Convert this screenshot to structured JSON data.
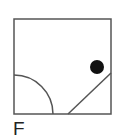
{
  "figure": {
    "label": "F",
    "frame": {
      "x": 14,
      "y": 19,
      "width": 97,
      "height": 95,
      "stroke": "#555555"
    },
    "arc": {
      "cx": 14,
      "cy": 114,
      "r": 39,
      "stroke": "#555555"
    },
    "line": {
      "x1": 68,
      "y1": 114,
      "x2": 111,
      "y2": 73,
      "stroke": "#555555"
    },
    "dot": {
      "cx": 97,
      "cy": 67,
      "r": 7,
      "fill": "#111111"
    }
  }
}
